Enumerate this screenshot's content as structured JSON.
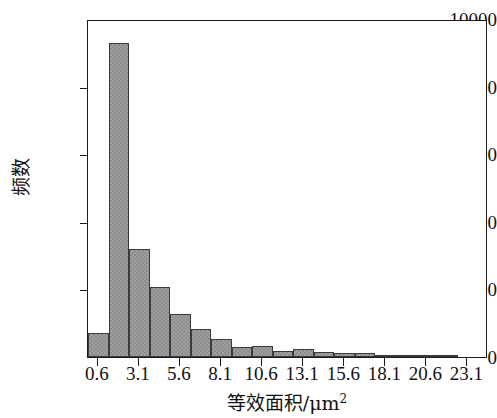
{
  "chart_data": {
    "type": "bar",
    "title": "",
    "subtitle": "",
    "xlabel": "等效面积/μm",
    "xlabel_sup": "2",
    "ylabel": "频数",
    "xtick_labels": [
      "0.6",
      "3.1",
      "5.6",
      "8.1",
      "10.6",
      "13.1",
      "15.6",
      "18.1",
      "20.6",
      "23.1"
    ],
    "ytick_labels": [
      "0",
      "2000",
      "4000",
      "6000",
      "8000",
      "10000"
    ],
    "ytick_values": [
      0,
      2000,
      4000,
      6000,
      8000,
      10000
    ],
    "ylim": [
      0,
      10000
    ],
    "xlim": [
      0.0,
      24.35
    ],
    "grid": false,
    "legend": null,
    "bin_width": 1.25,
    "bin_starts": [
      0.0,
      1.25,
      2.5,
      3.75,
      5.0,
      6.25,
      7.5,
      8.75,
      10.0,
      11.25,
      12.5,
      13.75,
      15.0,
      16.25,
      17.5,
      18.75,
      20.0,
      21.25
    ],
    "categories": [
      "0.0",
      "1.25",
      "2.5",
      "3.75",
      "5.0",
      "6.25",
      "7.5",
      "8.75",
      "10.0",
      "11.25",
      "12.5",
      "13.75",
      "15.0",
      "16.25",
      "17.5",
      "18.75",
      "20.0",
      "21.25"
    ],
    "values": [
      700,
      9300,
      3200,
      2080,
      1270,
      830,
      520,
      310,
      330,
      190,
      240,
      150,
      110,
      130,
      60,
      60,
      25,
      20
    ],
    "bar_color": "#8d8d8d",
    "bar_edge_color": "#3a3a3a",
    "axis_color": "#1a1a1a",
    "background_color": "#ffffff"
  }
}
